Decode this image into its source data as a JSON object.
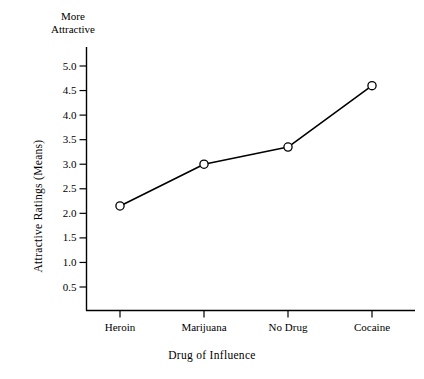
{
  "chart_data": {
    "type": "line",
    "title": "",
    "subtitle": "",
    "xlabel": "Drug of Influence",
    "ylabel": "Attractive Ratings (Means)",
    "axis_top_annotation": "More\nAttractive",
    "axis_top_annotation_line1": "More",
    "axis_top_annotation_line2": "Attractive",
    "categories": [
      "Heroin",
      "Marijuana",
      "No Drug",
      "Cocaine"
    ],
    "values": [
      2.15,
      3.0,
      3.35,
      4.6
    ],
    "series": [
      {
        "name": "Attractive Ratings (Means)",
        "values": [
          2.15,
          3.0,
          3.35,
          4.6
        ]
      }
    ],
    "ylim": [
      0,
      5.25
    ],
    "ytick_values": [
      0.5,
      1.0,
      1.5,
      2.0,
      2.5,
      3.0,
      3.5,
      4.0,
      4.5,
      5.0
    ],
    "ytick_labels": [
      "0.5",
      "1.0",
      "1.5",
      "2.0",
      "2.5",
      "3.0",
      "3.5",
      "4.0",
      "4.5",
      "5.0"
    ],
    "xtick_labels": [
      "Heroin",
      "Marijuana",
      "No Drug",
      "Cocaine"
    ],
    "grid": false,
    "legend": false,
    "legend_position": "none",
    "marker": "open-circle",
    "line_color": "#000000",
    "marker_face_color": "#ffffff",
    "marker_edge_color": "#000000",
    "background_color": "#ffffff"
  }
}
